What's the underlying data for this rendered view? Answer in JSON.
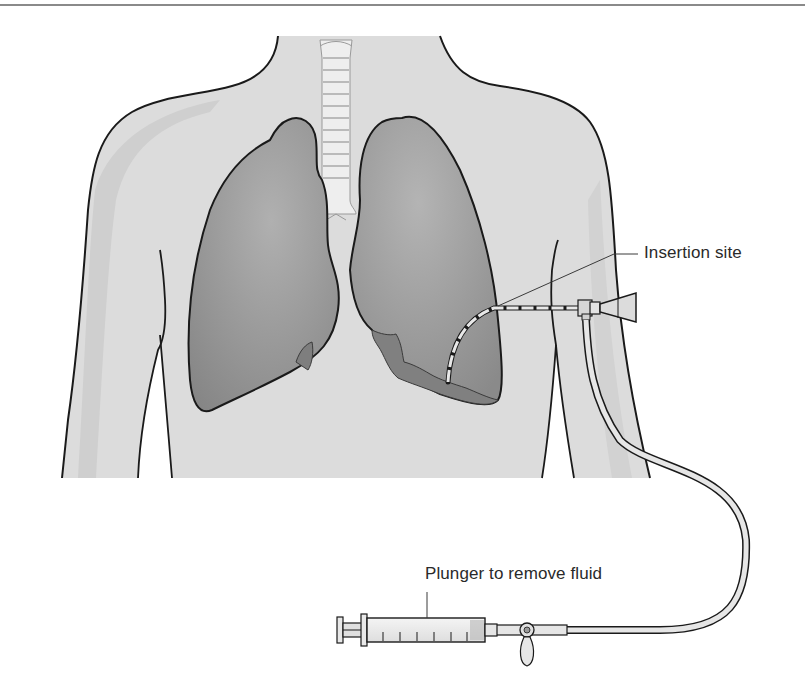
{
  "figure": {
    "type": "medical-illustration",
    "labels": {
      "insertion_site": "Insertion site",
      "plunger": "Plunger to remove fluid"
    },
    "parts": [
      "torso",
      "trachea",
      "right-lung",
      "left-lung",
      "pleural-fluid",
      "catheter",
      "drainage-tube",
      "three-way-stopcock",
      "syringe"
    ],
    "colors": {
      "background": "#ffffff",
      "skin": "#dcdcdc",
      "skin_shade": "#cfcfcf",
      "lung": "#9a9a9a",
      "lung_dark": "#7e7e7e",
      "fluid": "#808080",
      "outline": "#1a1a1a",
      "trachea": "#eeeeee",
      "top_rule": "#8a8a8a"
    }
  }
}
